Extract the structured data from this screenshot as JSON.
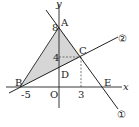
{
  "diagram": {
    "type": "coordinate-geometry",
    "axes": {
      "x_label": "x",
      "y_label": "y",
      "origin_label": "O"
    },
    "points": {
      "A": {
        "label": "A",
        "coord": [
          0,
          8
        ]
      },
      "B": {
        "label": "B",
        "coord": [
          -5,
          0
        ]
      },
      "C": {
        "label": "C",
        "coord": [
          3,
          4
        ]
      },
      "D": {
        "label": "D",
        "coord": [
          0,
          null
        ]
      },
      "E": {
        "label": "E",
        "coord": [
          null,
          0
        ]
      }
    },
    "tick_labels": {
      "x_neg5": "-5",
      "x_3": "3",
      "y_8": "8",
      "y_4": "4"
    },
    "lines": [
      {
        "id": "line1",
        "label": "①",
        "through": [
          "A",
          "C",
          "E"
        ]
      },
      {
        "id": "line2",
        "label": "②",
        "through": [
          "B",
          "D",
          "C"
        ]
      }
    ],
    "shaded_region": "triangle ABC",
    "colors": {
      "shade": "#d6d6d6",
      "stroke": "#222222"
    }
  }
}
